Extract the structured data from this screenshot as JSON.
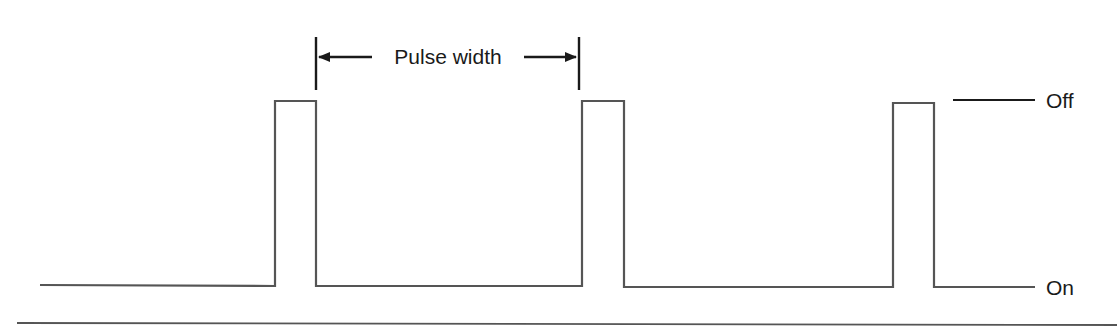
{
  "diagram": {
    "pulse_width_label": "Pulse width",
    "levels": {
      "off_label": "Off",
      "on_label": "On"
    },
    "colors": {
      "waveform": "#555555",
      "text": "#1a1a1a",
      "background": "#ffffff"
    },
    "pulses": [
      {
        "x_start": 275,
        "x_end": 316,
        "top_y": 101
      },
      {
        "x_start": 582,
        "x_end": 624,
        "top_y": 101
      },
      {
        "x_start": 893,
        "x_end": 934,
        "top_y": 103
      }
    ],
    "baseline_y": 286
  }
}
